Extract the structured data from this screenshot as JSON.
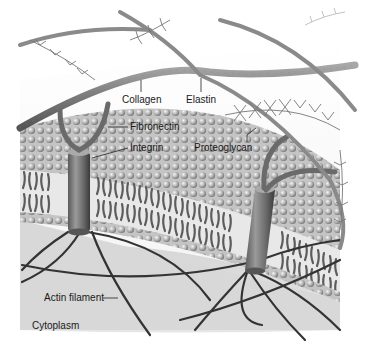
{
  "figure": {
    "labels": {
      "collagen": "Collagen",
      "elastin": "Elastin",
      "fibronectin": "Fibronectin",
      "integrin": "Integrin",
      "proteoglycan": "Proteoglycan",
      "actin_filament": "Actin filament",
      "cytoplasm": "Cytoplasm"
    }
  },
  "diagram": {
    "nodes": [
      {
        "id": "collagen",
        "label": "Collagen",
        "region": "extracellular"
      },
      {
        "id": "elastin",
        "label": "Elastin",
        "region": "extracellular"
      },
      {
        "id": "proteoglycan",
        "label": "Proteoglycan",
        "region": "extracellular"
      },
      {
        "id": "fibronectin",
        "label": "Fibronectin",
        "region": "extracellular"
      },
      {
        "id": "integrin",
        "label": "Integrin",
        "region": "membrane"
      },
      {
        "id": "actin_filament",
        "label": "Actin filament",
        "region": "cytoplasm"
      },
      {
        "id": "cytoplasm",
        "label": "Cytoplasm",
        "region": "cytoplasm"
      }
    ],
    "edges": [
      {
        "from": "fibronectin",
        "to": "integrin",
        "relation": "binds"
      },
      {
        "from": "integrin",
        "to": "actin_filament",
        "relation": "anchors"
      },
      {
        "from": "fibronectin",
        "to": "collagen",
        "relation": "binds"
      }
    ]
  }
}
